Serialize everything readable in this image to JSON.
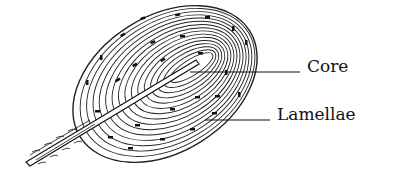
{
  "figure": {
    "labels": [
      {
        "id": "core",
        "text": "Core"
      },
      {
        "id": "lamellae",
        "text": "Lamellae"
      }
    ]
  },
  "colors": {
    "ink": "#111111",
    "background": "#ffffff"
  }
}
